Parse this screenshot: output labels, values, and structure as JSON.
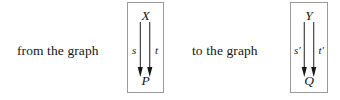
{
  "figure": {
    "background_color": "#ffffff",
    "ink_color": "#161616",
    "box_border_color": "#9a9a9a",
    "phrase_from": "from the graph",
    "phrase_to": "to the graph",
    "graphs": [
      {
        "id": "source-graph",
        "top_node": "X",
        "bottom_node": "P",
        "edges": [
          {
            "label": "s",
            "direction": "down"
          },
          {
            "label": "t",
            "direction": "down"
          }
        ]
      },
      {
        "id": "target-graph",
        "top_node": "Y",
        "bottom_node": "Q",
        "edges": [
          {
            "label": "s′",
            "direction": "down"
          },
          {
            "label": "t′",
            "direction": "down"
          }
        ]
      }
    ]
  }
}
